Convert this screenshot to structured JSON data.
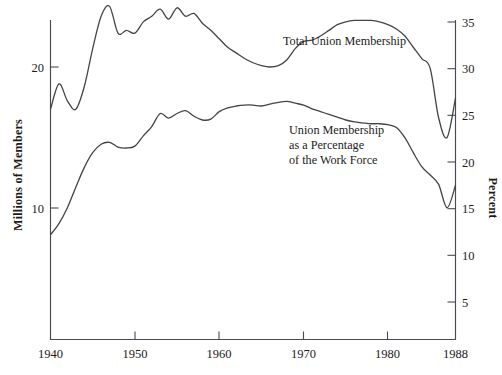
{
  "chart_data": {
    "type": "line",
    "title": "",
    "subtitle": "",
    "xlabel": "",
    "ylabel": "Millions of Members",
    "y2label": "Percent",
    "grid": false,
    "legend_position": "inline-annotations",
    "xlim": [
      1940,
      1988
    ],
    "x_ticks": [
      1940,
      1950,
      1960,
      1970,
      1980,
      1988
    ],
    "x_tick_labels": [
      "1940",
      "1950",
      "1960",
      "1970",
      "1980",
      "1988"
    ],
    "ylim": [
      0,
      24.4
    ],
    "y_ticks": [
      10,
      20
    ],
    "y_tick_labels": [
      "10",
      "20"
    ],
    "y2lim": [
      0,
      35
    ],
    "y2_ticks": [
      5,
      10,
      15,
      20,
      25,
      30,
      35
    ],
    "y2_tick_labels": [
      "5",
      "10",
      "15",
      "20",
      "25",
      "30",
      "35"
    ],
    "annotations": [
      {
        "id": "total-union-membership",
        "text": "Total Union Membership",
        "lines": [
          "Total Union Membership"
        ],
        "x": 283,
        "y": 45
      },
      {
        "id": "union-membership-percentage",
        "text": "Union Membership as a Percentage of the Work Force",
        "lines": [
          "Union Membership",
          "as a Percentage",
          "of the Work Force"
        ],
        "x": 289,
        "y": 134
      }
    ],
    "series": [
      {
        "name": "Total Union Membership",
        "axis": "left",
        "units": "millions of members",
        "x": [
          1940,
          1941,
          1942,
          1943,
          1944,
          1945,
          1946,
          1947,
          1948,
          1949,
          1950,
          1951,
          1952,
          1953,
          1954,
          1955,
          1956,
          1957,
          1958,
          1959,
          1960,
          1961,
          1962,
          1963,
          1964,
          1965,
          1966,
          1967,
          1968,
          1969,
          1970,
          1971,
          1972,
          1973,
          1974,
          1975,
          1976,
          1977,
          1978,
          1979,
          1980,
          1981,
          1982,
          1983,
          1984,
          1985,
          1986,
          1987,
          1988
        ],
        "values": [
          17.0,
          18.8,
          17.6,
          17.0,
          18.6,
          21.3,
          23.6,
          24.3,
          22.4,
          22.6,
          22.4,
          23.2,
          23.6,
          24.1,
          23.4,
          24.2,
          23.6,
          23.8,
          23.1,
          22.6,
          22.0,
          21.4,
          21.0,
          20.6,
          20.3,
          20.1,
          20.0,
          20.1,
          20.5,
          21.3,
          21.8,
          21.9,
          22.2,
          22.6,
          23.0,
          23.2,
          23.3,
          23.3,
          23.3,
          23.2,
          23.0,
          22.7,
          22.2,
          21.4,
          20.6,
          19.9,
          16.4,
          15.0,
          17.8
        ]
      },
      {
        "name": "Union Membership as a Percentage of the Work Force",
        "axis": "right",
        "units": "percent",
        "x": [
          1940,
          1941,
          1942,
          1943,
          1944,
          1945,
          1946,
          1947,
          1948,
          1949,
          1950,
          1951,
          1952,
          1953,
          1954,
          1955,
          1956,
          1957,
          1958,
          1959,
          1960,
          1961,
          1962,
          1963,
          1964,
          1965,
          1966,
          1967,
          1968,
          1969,
          1970,
          1971,
          1972,
          1973,
          1974,
          1975,
          1976,
          1977,
          1978,
          1979,
          1980,
          1981,
          1982,
          1983,
          1984,
          1985,
          1986,
          1987,
          1988
        ],
        "values": [
          12.2,
          13.4,
          15.1,
          17.3,
          19.4,
          21.0,
          21.9,
          22.1,
          21.6,
          21.5,
          21.7,
          22.8,
          23.8,
          25.2,
          24.7,
          25.2,
          25.5,
          24.9,
          24.5,
          24.6,
          25.4,
          25.8,
          26.0,
          26.1,
          26.1,
          26.0,
          26.2,
          26.4,
          26.5,
          26.3,
          26.1,
          25.7,
          25.4,
          25.1,
          24.8,
          24.5,
          24.3,
          24.2,
          24.1,
          24.1,
          24.0,
          23.7,
          22.6,
          21.0,
          19.5,
          18.6,
          17.6,
          15.1,
          17.5
        ]
      }
    ]
  },
  "figure": {
    "background_color": "#ffffff",
    "line_color": "#444448",
    "axis_color": "#4a4a52",
    "text_color": "#1b1b1b"
  }
}
